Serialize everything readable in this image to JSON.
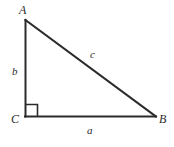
{
  "figure": {
    "kind": "right-triangle-diagram",
    "background_color": "#ffffff",
    "stroke_color": "#2b2b2b",
    "vertices": [
      {
        "id": "A",
        "label": "A",
        "x": 25,
        "y": 20
      },
      {
        "id": "B",
        "label": "B",
        "x": 156,
        "y": 116
      },
      {
        "id": "C",
        "label": "C",
        "x": 25,
        "y": 116
      }
    ],
    "sides": [
      {
        "id": "a",
        "label": "a",
        "from": "C",
        "to": "B",
        "role": "base"
      },
      {
        "id": "b",
        "label": "b",
        "from": "C",
        "to": "A",
        "role": "height"
      },
      {
        "id": "c",
        "label": "c",
        "from": "A",
        "to": "B",
        "role": "hypotenuse"
      }
    ],
    "right_angle": {
      "at_vertex": "C",
      "marker": "square",
      "size": 12
    }
  }
}
